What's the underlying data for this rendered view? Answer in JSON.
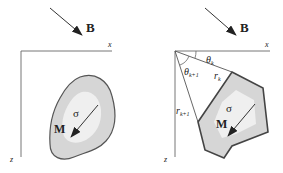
{
  "colors": {
    "line": "#555555",
    "shape_fill": "#d6d6d6",
    "shape_inner": "#f2f2f2",
    "text": "#222222"
  },
  "left_panel": {
    "field_label": "B",
    "x_axis_label": "x",
    "z_axis_label": "z",
    "conductivity_label": "σ",
    "magnetization_label": "M",
    "shape": "arbitrary-body"
  },
  "right_panel": {
    "field_label": "B",
    "x_axis_label": "x",
    "z_axis_label": "z",
    "theta_k": {
      "base": "θ",
      "sub": "k"
    },
    "theta_k1": {
      "base": "θ",
      "sub": "k+1"
    },
    "r_k": {
      "base": "r",
      "sub": "k"
    },
    "r_k1": {
      "base": "r",
      "sub": "k+1"
    },
    "conductivity_label": "σ",
    "magnetization_label": "M",
    "shape": "polygon-body"
  }
}
